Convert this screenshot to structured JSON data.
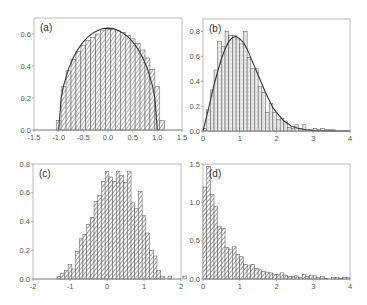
{
  "chart_data": [
    {
      "panel": "a",
      "type": "bar",
      "label": "(a)",
      "xlim": [
        -1.5,
        1.5
      ],
      "ylim": [
        0,
        0.7
      ],
      "xticks": [
        "-1.5",
        "-1.0",
        "-0.5",
        "0.0",
        "0.5",
        "1.0",
        "1.5"
      ],
      "xtick_values": [
        -1.5,
        -1.0,
        -0.5,
        0.0,
        0.5,
        1.0,
        1.5
      ],
      "yticks": [
        "0.0",
        "0.2",
        "0.4",
        "0.6"
      ],
      "ytick_values": [
        0,
        0.2,
        0.4,
        0.6
      ],
      "bin_width": 0.1,
      "bin_start": -1.05,
      "values": [
        0.06,
        0.27,
        0.37,
        0.44,
        0.49,
        0.53,
        0.56,
        0.58,
        0.6,
        0.62,
        0.63,
        0.63,
        0.62,
        0.61,
        0.59,
        0.57,
        0.54,
        0.5,
        0.45,
        0.38,
        0.27,
        0.06
      ],
      "curve": {
        "type": "semicircle",
        "points": [
          [
            -1.0,
            0
          ],
          [
            -0.95,
            0.199
          ],
          [
            -0.9,
            0.277
          ],
          [
            -0.8,
            0.382
          ],
          [
            -0.7,
            0.455
          ],
          [
            -0.6,
            0.509
          ],
          [
            -0.5,
            0.551
          ],
          [
            -0.4,
            0.584
          ],
          [
            -0.3,
            0.607
          ],
          [
            -0.2,
            0.624
          ],
          [
            -0.1,
            0.634
          ],
          [
            0,
            0.637
          ],
          [
            0.1,
            0.634
          ],
          [
            0.2,
            0.624
          ],
          [
            0.3,
            0.607
          ],
          [
            0.4,
            0.584
          ],
          [
            0.5,
            0.551
          ],
          [
            0.6,
            0.509
          ],
          [
            0.7,
            0.455
          ],
          [
            0.8,
            0.382
          ],
          [
            0.9,
            0.277
          ],
          [
            0.95,
            0.199
          ],
          [
            1.0,
            0
          ]
        ]
      },
      "grid": false
    },
    {
      "panel": "b",
      "type": "bar",
      "label": "(b)",
      "xlim": [
        0,
        4
      ],
      "ylim": [
        0,
        0.9
      ],
      "xticks": [
        "0",
        "1",
        "2",
        "3",
        "4"
      ],
      "xtick_values": [
        0,
        1,
        2,
        3,
        4
      ],
      "yticks": [
        "0.0",
        "0.2",
        "0.4",
        "0.6",
        "0.8"
      ],
      "ytick_values": [
        0,
        0.2,
        0.4,
        0.6,
        0.8
      ],
      "bin_width": 0.1,
      "bin_start": 0.0,
      "values": [
        0.02,
        0.17,
        0.33,
        0.49,
        0.72,
        0.68,
        0.8,
        0.77,
        0.77,
        0.74,
        0.7,
        0.8,
        0.59,
        0.5,
        0.5,
        0.36,
        0.31,
        0.15,
        0.22,
        0.15,
        0.09,
        0.1,
        0.08,
        0.03,
        0.02,
        0.05,
        0.02,
        0.05,
        0.01,
        0.01,
        0.02,
        0.01,
        0.02,
        0.01,
        0.01,
        0.01,
        0.0,
        0.0,
        0.0,
        0.0
      ],
      "curve": {
        "type": "wigner-surmise",
        "points": [
          [
            0,
            0
          ],
          [
            0.1,
            0.12
          ],
          [
            0.2,
            0.24
          ],
          [
            0.3,
            0.37
          ],
          [
            0.4,
            0.48
          ],
          [
            0.5,
            0.58
          ],
          [
            0.6,
            0.66
          ],
          [
            0.7,
            0.72
          ],
          [
            0.8,
            0.75
          ],
          [
            0.9,
            0.76
          ],
          [
            1.0,
            0.74
          ],
          [
            1.1,
            0.71
          ],
          [
            1.2,
            0.66
          ],
          [
            1.3,
            0.59
          ],
          [
            1.4,
            0.52
          ],
          [
            1.5,
            0.45
          ],
          [
            1.6,
            0.38
          ],
          [
            1.7,
            0.31
          ],
          [
            1.8,
            0.25
          ],
          [
            1.9,
            0.19
          ],
          [
            2.0,
            0.15
          ],
          [
            2.2,
            0.08
          ],
          [
            2.4,
            0.04
          ],
          [
            2.6,
            0.02
          ],
          [
            2.8,
            0.01
          ],
          [
            3.0,
            0.004
          ],
          [
            3.5,
            0.0003
          ],
          [
            4.0,
            0
          ]
        ]
      },
      "grid": false
    },
    {
      "panel": "c",
      "type": "bar",
      "label": "(c)",
      "xlim": [
        -2,
        2
      ],
      "ylim": [
        0,
        0.8
      ],
      "xticks": [
        "-2",
        "-1",
        "0",
        "1",
        "2"
      ],
      "xtick_values": [
        -2,
        -1,
        0,
        1,
        2
      ],
      "yticks": [
        "0.0",
        "0.2",
        "0.4",
        "0.6",
        "0.8"
      ],
      "ytick_values": [
        0,
        0.2,
        0.4,
        0.6,
        0.8
      ],
      "bin_width": 0.1,
      "bin_start": -1.35,
      "values": [
        0.02,
        0.04,
        0.06,
        0.1,
        0.07,
        0.19,
        0.28,
        0.31,
        0.38,
        0.43,
        0.54,
        0.58,
        0.68,
        0.75,
        0.71,
        0.68,
        0.75,
        0.72,
        0.67,
        0.75,
        0.53,
        0.49,
        0.61,
        0.44,
        0.32,
        0.2,
        0.16,
        0.06,
        0.02,
        0.0,
        0.02,
        0.0,
        0.0,
        0.0,
        0.02,
        0.0
      ],
      "grid": false
    },
    {
      "panel": "d",
      "type": "bar",
      "label": "(d)",
      "xlim": [
        0,
        4
      ],
      "ylim": [
        0,
        1.5
      ],
      "xticks": [
        "0",
        "1",
        "2",
        "3",
        "4"
      ],
      "xtick_values": [
        0,
        1,
        2,
        3,
        4
      ],
      "yticks": [
        "0.0",
        "0.5",
        "1.0",
        "1.5"
      ],
      "ytick_values": [
        0,
        0.5,
        1.0,
        1.5
      ],
      "bin_width": 0.1,
      "bin_start": 0.0,
      "values": [
        1.2,
        1.47,
        1.1,
        0.95,
        0.69,
        0.66,
        0.41,
        0.39,
        0.42,
        0.32,
        0.29,
        0.19,
        0.17,
        0.19,
        0.14,
        0.12,
        0.1,
        0.09,
        0.08,
        0.06,
        0.06,
        0.08,
        0.05,
        0.03,
        0.03,
        0.04,
        0.02,
        0.06,
        0.03,
        0.05,
        0.04,
        0.02,
        0.03,
        0.01,
        0.0,
        0.02,
        0.02,
        0.01,
        0.02,
        0.02
      ],
      "grid": false
    }
  ],
  "panels": {
    "a": {
      "label": "(a)"
    },
    "b": {
      "label": "(b)"
    },
    "c": {
      "label": "(c)"
    },
    "d": {
      "label": "(d)"
    }
  },
  "style": {
    "bar_stroke": "#555555",
    "bar_fill": "#d9d9d9",
    "hatch": "#555555",
    "axis": "#999999",
    "curve": "#333333"
  }
}
